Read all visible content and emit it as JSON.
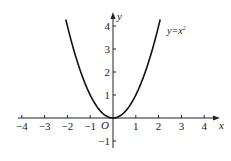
{
  "chart_data": {
    "type": "line",
    "title": "",
    "function_label": "y=x²",
    "function_label_base": "y=x",
    "function_label_exp": "2",
    "xlabel": "x",
    "ylabel": "y",
    "origin_label": "O",
    "x_ticks": [
      -4,
      -3,
      -2,
      -1,
      1,
      2,
      3,
      4
    ],
    "x_tick_labels": [
      "−4",
      "−3",
      "−2",
      "−1",
      "1",
      "2",
      "3",
      "4"
    ],
    "y_ticks": [
      -1,
      1,
      2,
      3,
      4
    ],
    "y_tick_labels": [
      "−1",
      "1",
      "2",
      "3",
      "4"
    ],
    "xlim": [
      -4.5,
      4.6
    ],
    "ylim": [
      -1.4,
      4.5
    ],
    "grid": false,
    "series": [
      {
        "name": "y=x^2",
        "x": [
          -2.07,
          -2,
          -1.5,
          -1,
          -0.5,
          0,
          0.5,
          1,
          1.5,
          2,
          2.07
        ],
        "y": [
          4.28,
          4,
          2.25,
          1,
          0.25,
          0,
          0.25,
          1,
          2.25,
          4,
          4.28
        ]
      }
    ],
    "color": "#111111"
  }
}
